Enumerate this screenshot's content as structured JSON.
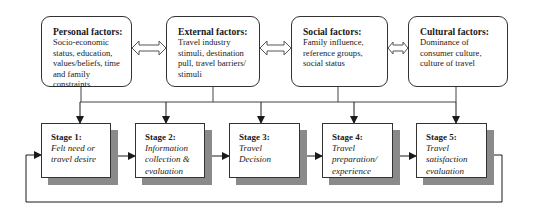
{
  "diagram": {
    "factors": [
      {
        "title": "Personal factors:",
        "body": "Socio-economic status, education, values/beliefs, time and family constraints"
      },
      {
        "title": "External factors:",
        "body": "Travel industry stimuli, destination pull, travel barriers/ stimuli"
      },
      {
        "title": "Social factors:",
        "body": "Family influence, reference groups, social status"
      },
      {
        "title": "Cultural factors:",
        "body": "Dominance of consumer culture, culture of travel"
      }
    ],
    "stages": [
      {
        "label": "Stage 1:",
        "desc": "Felt need or\ntravel desire"
      },
      {
        "label": "Stage 2:",
        "desc": "Information\ncollection &\nevaluation"
      },
      {
        "label": "Stage 3:",
        "desc": "Travel\nDecision"
      },
      {
        "label": "Stage 4:",
        "desc": "Travel\npreparation/\nexperience"
      },
      {
        "label": "Stage 5:",
        "desc": "Travel\nsatisfaction\nevaluation"
      }
    ],
    "connections": {
      "factor_links": "double-headed arrows between adjacent factor boxes",
      "factor_to_stage": "all factor boxes feed a shared bus with arrows down into each stage",
      "stage_flow": "Stage 1 -> Stage 2 -> Stage 3 -> Stage 4 -> Stage 5",
      "feedback": "Stage 5 loops back to Stage 1"
    }
  }
}
